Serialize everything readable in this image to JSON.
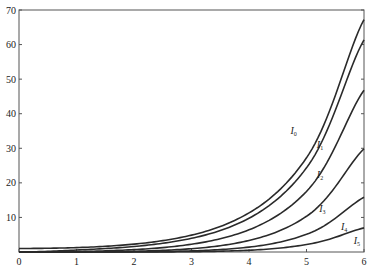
{
  "chart_data": {
    "type": "line",
    "title": "",
    "xlabel": "",
    "ylabel": "",
    "xlim": [
      0,
      6
    ],
    "ylim": [
      0,
      70
    ],
    "grid": false,
    "legend_position": "inline-labels",
    "x_ticks": [
      0,
      1,
      2,
      3,
      4,
      5,
      6
    ],
    "y_ticks": [
      10,
      20,
      30,
      40,
      50,
      60,
      70
    ],
    "x": [
      0,
      1,
      2,
      3,
      4,
      5,
      6
    ],
    "series": [
      {
        "name": "I0",
        "label_main": "I",
        "label_sub": "0",
        "values": [
          1.0,
          1.266,
          2.28,
          4.881,
          11.3,
          27.24,
          67.23
        ]
      },
      {
        "name": "I1",
        "label_main": "I",
        "label_sub": "1",
        "values": [
          0.0,
          0.565,
          1.591,
          3.953,
          9.759,
          24.34,
          61.34
        ]
      },
      {
        "name": "I2",
        "label_main": "I",
        "label_sub": "2",
        "values": [
          0.0,
          0.136,
          0.689,
          2.245,
          6.422,
          17.51,
          46.79
        ]
      },
      {
        "name": "I3",
        "label_main": "I",
        "label_sub": "3",
        "values": [
          0.0,
          0.022,
          0.213,
          0.96,
          3.337,
          10.33,
          29.85
        ]
      },
      {
        "name": "I4",
        "label_main": "I",
        "label_sub": "4",
        "values": [
          0.0,
          0.003,
          0.051,
          0.326,
          1.416,
          5.108,
          15.83
        ]
      },
      {
        "name": "I5",
        "label_main": "I",
        "label_sub": "5",
        "values": [
          0.0,
          0.0003,
          0.01,
          0.091,
          0.505,
          2.161,
          6.978
        ]
      }
    ],
    "label_positions": [
      {
        "x": 4.72,
        "y": 34
      },
      {
        "x": 5.18,
        "y": 30
      },
      {
        "x": 5.18,
        "y": 21.5
      },
      {
        "x": 5.22,
        "y": 11.5
      },
      {
        "x": 5.6,
        "y": 6.5
      },
      {
        "x": 5.82,
        "y": 2.2
      }
    ],
    "colors": {
      "line": "#2a2a2a",
      "axis": "#555555"
    }
  }
}
